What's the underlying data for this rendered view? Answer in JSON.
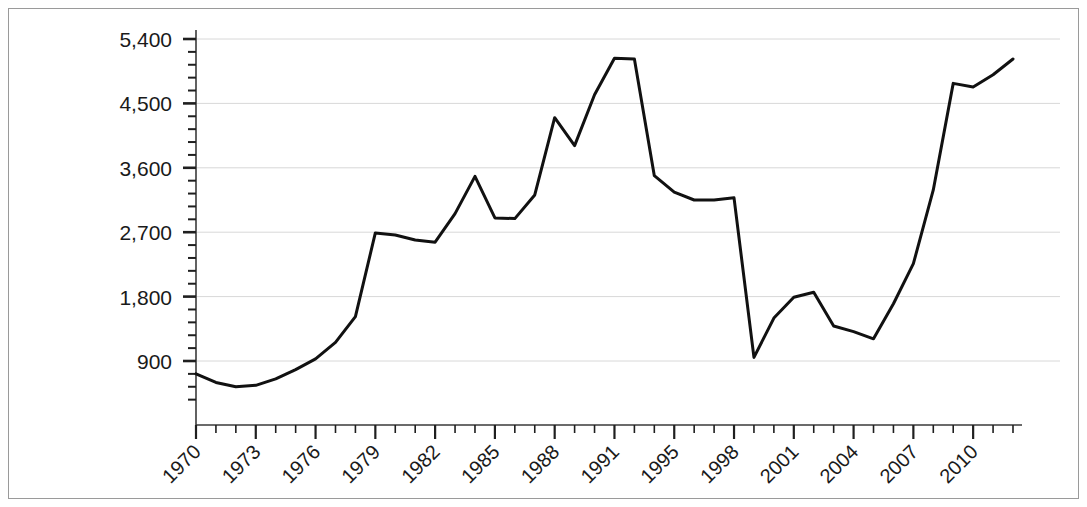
{
  "chart_data": {
    "type": "line",
    "title": "",
    "subtitle": "",
    "xlabel": "",
    "ylabel": "",
    "xlim": [
      1970,
      2011
    ],
    "ylim": [
      360,
      5400
    ],
    "grid": true,
    "legend": false,
    "legend_position": "none",
    "y_ticks_major": [
      900,
      1800,
      2700,
      3600,
      4500,
      5400
    ],
    "y_tick_labels": [
      "900",
      "1,800",
      "2,700",
      "3,600",
      "4,500",
      "5,400"
    ],
    "y_minor_interval": 180,
    "x_ticks_major": [
      1970,
      1973,
      1976,
      1979,
      1982,
      1985,
      1988,
      1991,
      1994,
      1997,
      2000,
      2003,
      2006,
      2009
    ],
    "x_tick_labels": [
      "1970",
      "1973",
      "1976",
      "1979",
      "1982",
      "1985",
      "1988",
      "1991",
      "1995",
      "1998",
      "2001",
      "2004",
      "2007",
      "2010"
    ],
    "x_tick_label_rotation": -45,
    "x_minor_interval": 1,
    "line_color": "#111111",
    "line_width": 3,
    "gridline_color": "#d8d8d8",
    "axis_color": "#3a3a3a",
    "x": [
      1970,
      1971,
      1972,
      1973,
      1974,
      1975,
      1976,
      1977,
      1978,
      1979,
      1980,
      1981,
      1982,
      1983,
      1984,
      1985,
      1986,
      1987,
      1988,
      1989,
      1990,
      1991,
      1992,
      1993,
      1994,
      1995,
      1996,
      1997,
      1998,
      1999,
      2000,
      2001,
      2002,
      2003,
      2004,
      2005,
      2006,
      2007,
      2008,
      2009,
      2010,
      2011
    ],
    "y": [
      720,
      600,
      540,
      560,
      650,
      780,
      930,
      1160,
      1520,
      2690,
      2660,
      2590,
      2560,
      2960,
      3480,
      2900,
      2890,
      3220,
      4300,
      3910,
      4620,
      5130,
      5120,
      3490,
      3260,
      3150,
      3150,
      3180,
      950,
      1500,
      1790,
      1860,
      1390,
      1310,
      1210,
      1700,
      2260,
      3290,
      4780,
      4730,
      4900,
      5120
    ],
    "series": [
      {
        "name": "series-1",
        "values": [
          720,
          600,
          540,
          560,
          650,
          780,
          930,
          1160,
          1520,
          2690,
          2660,
          2590,
          2560,
          2960,
          3480,
          2900,
          2890,
          3220,
          4300,
          3910,
          4620,
          5130,
          5120,
          3490,
          3260,
          3150,
          3150,
          3180,
          950,
          1500,
          1790,
          1860,
          1390,
          1310,
          1210,
          1700,
          2260,
          3290,
          4780,
          4730,
          4900,
          5120
        ]
      }
    ],
    "annotations": []
  },
  "figure": {
    "border_color": "#9a9a9a",
    "background": "#ffffff"
  }
}
